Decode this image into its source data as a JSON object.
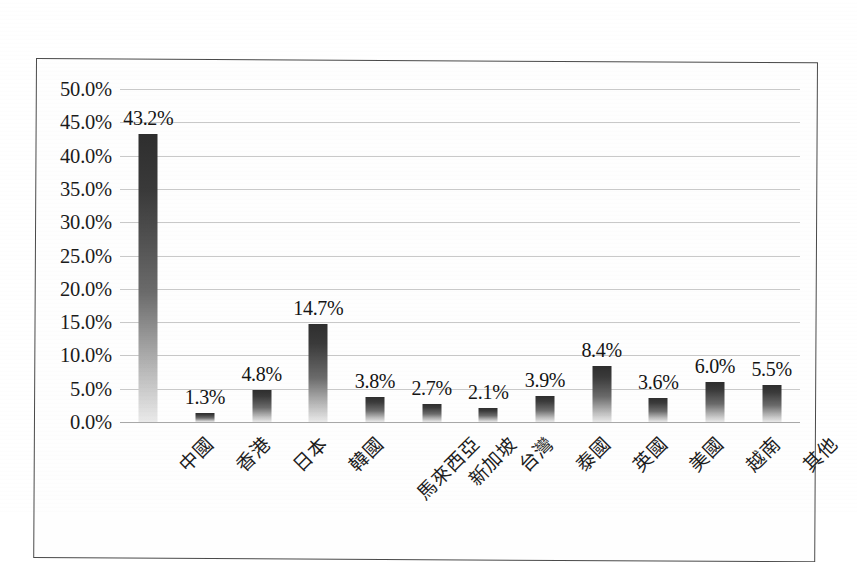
{
  "chart_data": {
    "type": "bar",
    "title": "",
    "xlabel": "",
    "ylabel": "",
    "ylim": [
      0,
      50
    ],
    "ytick_step": 5,
    "ytick_labels": [
      "50.0%",
      "45.0%",
      "40.0%",
      "35.0%",
      "30.0%",
      "25.0%",
      "20.0%",
      "15.0%",
      "10.0%",
      "5.0%",
      "0.0%"
    ],
    "grid": true,
    "legend": "none",
    "value_label_format": "0.0%",
    "categories": [
      "中國",
      "香港",
      "日本",
      "韓國",
      "馬來西亞",
      "新加坡",
      "台灣",
      "泰國",
      "英國",
      "美國",
      "越南",
      "其他"
    ],
    "values": [
      43.2,
      1.3,
      4.8,
      14.7,
      3.8,
      2.7,
      2.1,
      3.9,
      8.4,
      3.6,
      6.0,
      5.5
    ],
    "value_labels": [
      "43.2%",
      "1.3%",
      "4.8%",
      "14.7%",
      "3.8%",
      "2.7%",
      "2.1%",
      "3.9%",
      "8.4%",
      "3.6%",
      "6.0%",
      "5.5%"
    ]
  },
  "style": {
    "bar_top_color": "#2e2e2e",
    "bar_bottom_color": "#eaeaea",
    "gridline_color": "#c9c9c9",
    "border_color": "#4a4a4a",
    "text_color": "#1b1b1b",
    "background": "#ffffff"
  }
}
